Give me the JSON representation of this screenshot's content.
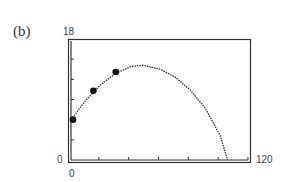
{
  "panel": {
    "label": "(b)"
  },
  "chart_data": {
    "type": "line",
    "title": "",
    "xlabel": "",
    "ylabel": "",
    "xlim": [
      0,
      120
    ],
    "ylim": [
      0,
      18
    ],
    "x_tick_step": 20,
    "y_tick_step": 3,
    "axis_labels": {
      "ymax": "18",
      "ymin": "0",
      "xmin": "0",
      "xmax": "120"
    },
    "grid": false,
    "legend": null,
    "series": [
      {
        "name": "model curve",
        "style": "dotted",
        "shape": "parabola",
        "peak": {
          "x": 48,
          "y": 14.1
        },
        "x": [
          0,
          10,
          20,
          30,
          40,
          48,
          60,
          70,
          80,
          90,
          100,
          105
        ],
        "values": [
          6.0,
          8.9,
          11.2,
          12.9,
          13.9,
          14.1,
          13.5,
          12.3,
          10.4,
          7.7,
          3.6,
          0
        ]
      },
      {
        "name": "data points",
        "style": "markers",
        "x": [
          0,
          15,
          30
        ],
        "values": [
          6.0,
          10.3,
          13.1
        ]
      }
    ],
    "colors": {
      "curve": "#333333",
      "points": "#111111",
      "frame": "#333333"
    }
  }
}
